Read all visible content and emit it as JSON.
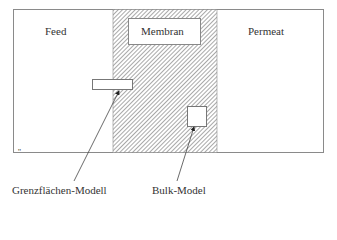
{
  "diagram": {
    "regions": {
      "feed": "Feed",
      "membrane": "Membran",
      "permeate": "Permeat"
    },
    "callouts": {
      "interface_model": "Grenzflächen-Modell",
      "bulk_model": "Bulk-Model"
    },
    "tick_mark": "''",
    "colors": {
      "outline": "#888888",
      "hatch": "#777777",
      "arrow": "#333333",
      "background": "#ffffff"
    }
  }
}
